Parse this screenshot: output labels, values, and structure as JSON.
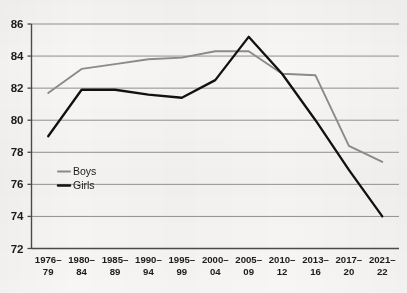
{
  "chart_data": {
    "type": "line",
    "title": "",
    "subtitle": "",
    "xlabel": "",
    "ylabel": "",
    "grid": true,
    "legend_position": "inside-left",
    "categories": [
      "1976–\n79",
      "1980–\n84",
      "1985–\n89",
      "1990–\n94",
      "1995–\n99",
      "2000–\n04",
      "2005–\n09",
      "2010–\n12",
      "2013–\n16",
      "2017–\n20",
      "2021–\n22"
    ],
    "category_lines": [
      [
        "1976–",
        "79"
      ],
      [
        "1980–",
        "84"
      ],
      [
        "1985–",
        "89"
      ],
      [
        "1990–",
        "94"
      ],
      [
        "1995–",
        "99"
      ],
      [
        "2000–",
        "04"
      ],
      [
        "2005–",
        "09"
      ],
      [
        "2010–",
        "12"
      ],
      [
        "2013–",
        "16"
      ],
      [
        "2017–",
        "20"
      ],
      [
        "2021–",
        "22"
      ]
    ],
    "ylim": [
      72,
      86
    ],
    "yticks": [
      72,
      74,
      76,
      78,
      80,
      82,
      84,
      86
    ],
    "ytick_labels": [
      "72",
      "74",
      "76",
      "78",
      "80",
      "82",
      "84",
      "86"
    ],
    "series": [
      {
        "name": "Boys",
        "color": "#8a8a8a",
        "values": [
          81.7,
          83.2,
          83.5,
          83.8,
          83.9,
          84.3,
          84.3,
          82.9,
          82.8,
          78.4,
          77.4
        ]
      },
      {
        "name": "Girls",
        "color": "#111111",
        "values": [
          79.0,
          81.9,
          81.9,
          81.6,
          81.4,
          82.5,
          85.2,
          82.9,
          80.0,
          76.9,
          74.0
        ]
      }
    ],
    "legend": [
      {
        "label": "Boys",
        "color": "#8a8a8a"
      },
      {
        "label": "Girls",
        "color": "#111111"
      }
    ]
  },
  "colors": {
    "background": "#f7f6f4",
    "gridline": "#8f8f8f",
    "axis": "#4a4a4a",
    "boys": "#8a8a8a",
    "girls": "#111111"
  }
}
